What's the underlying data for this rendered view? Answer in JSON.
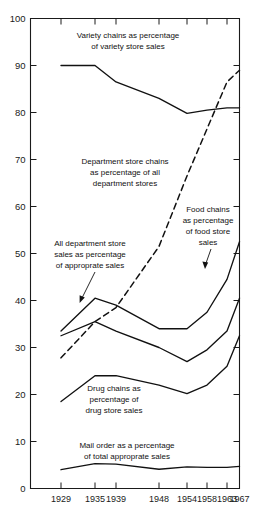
{
  "chart_data": {
    "type": "line",
    "title": "",
    "xlabel": "",
    "ylabel": "",
    "x": [
      1929,
      1935,
      1939,
      1948,
      1954,
      1958,
      1963,
      1967
    ],
    "xtick_labels": [
      "1929",
      "1935",
      "1939",
      "1948",
      "1954",
      "1958",
      "1963",
      "1967"
    ],
    "ytick_labels": [
      "0",
      "10",
      "20",
      "30",
      "40",
      "50",
      "60",
      "70",
      "80",
      "90",
      "100"
    ],
    "ylim": [
      0,
      100
    ],
    "ytick_step": 10,
    "grid": false,
    "legend": "inline-annotations",
    "series": [
      {
        "name": "Variety chains as percentage of variety store sales",
        "style": "solid",
        "values": [
          90.0,
          90.0,
          86.5,
          83.0,
          79.8,
          80.5,
          81.0,
          81.0
        ]
      },
      {
        "name": "Department store chains as percentage of all department stores",
        "style": "dashed",
        "values": [
          27.8,
          35.5,
          38.5,
          51.5,
          66.5,
          76.5,
          86.5,
          89.0
        ]
      },
      {
        "name": "All department store sales as percentage of approprate sales",
        "style": "solid",
        "values": [
          33.5,
          40.5,
          39.0,
          34.0,
          34.0,
          37.5,
          44.5,
          52.5
        ]
      },
      {
        "name": "Food chains as percentage of food store sales",
        "style": "solid",
        "values": [
          32.5,
          35.5,
          33.5,
          30.0,
          27.0,
          29.5,
          33.5,
          40.5
        ]
      },
      {
        "name": "Drug chains as percentage of drug store sales",
        "style": "solid",
        "values": [
          18.5,
          24.0,
          24.0,
          22.0,
          20.2,
          22.0,
          26.0,
          32.5
        ]
      },
      {
        "name": "Mail order as a percentage of total approprate sales",
        "style": "solid",
        "values": [
          4.0,
          5.3,
          5.2,
          4.1,
          4.6,
          4.5,
          4.5,
          4.7
        ]
      }
    ],
    "annotations": [
      {
        "id": "variety-chains",
        "lines": [
          "Variety chains as percentage",
          "of variety store sales"
        ],
        "has_leader": false
      },
      {
        "id": "department-store-chains",
        "lines": [
          "Department store chains",
          "as percentage of all",
          "department stores"
        ],
        "has_leader": false
      },
      {
        "id": "food-chains",
        "lines": [
          "Food chains",
          "as percentage",
          "of food store",
          "sales"
        ],
        "has_leader": true
      },
      {
        "id": "all-department-store-sales",
        "lines": [
          "All department store",
          "sales as percentage",
          "of approprate sales"
        ],
        "has_leader": true
      },
      {
        "id": "drug-chains",
        "lines": [
          "Drug chains as",
          "percentage of",
          "drug store sales"
        ],
        "has_leader": false
      },
      {
        "id": "mail-order",
        "lines": [
          "Mail order as a percentage",
          "of total approprate sales"
        ],
        "has_leader": false
      }
    ],
    "colors": {
      "line": "#111111",
      "axis": "#1a1a1a",
      "background": "#ffffff",
      "text": "#111111"
    }
  }
}
